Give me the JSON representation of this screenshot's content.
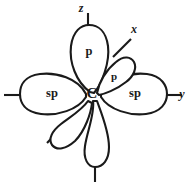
{
  "diagram": {
    "atom": {
      "symbol": "C",
      "name": "central-carbon-atom"
    },
    "stroke_color": "#1a1a1a",
    "background_color": "#ffffff",
    "orbitals": [
      {
        "id": "p-up",
        "label": "p",
        "direction": "up",
        "kind": "p"
      },
      {
        "id": "p-upright",
        "label": "p",
        "direction": "upper-right",
        "kind": "p"
      },
      {
        "id": "sp-left",
        "label": "sp",
        "direction": "left",
        "kind": "sp"
      },
      {
        "id": "sp-right",
        "label": "sp",
        "direction": "right",
        "kind": "sp"
      },
      {
        "id": "p-down",
        "label": "",
        "direction": "down",
        "kind": "p"
      },
      {
        "id": "p-downleft",
        "label": "",
        "direction": "lower-left",
        "kind": "p"
      }
    ],
    "axes": [
      {
        "id": "z",
        "label": "z",
        "direction": "up"
      },
      {
        "id": "x",
        "label": "x",
        "direction": "upper-right"
      },
      {
        "id": "y",
        "label": "y",
        "direction": "right"
      },
      {
        "id": "z-neg",
        "label": "",
        "direction": "down"
      },
      {
        "id": "y-neg",
        "label": "",
        "direction": "left"
      },
      {
        "id": "x-neg",
        "label": "",
        "direction": "lower-left"
      }
    ]
  }
}
